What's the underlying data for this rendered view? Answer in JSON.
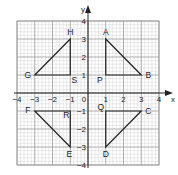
{
  "diagram": {
    "type": "coordinate-grid",
    "axes": {
      "x_label": "x",
      "y_label": "y",
      "x_range": [
        -4,
        4
      ],
      "y_range": [
        -4,
        4
      ],
      "x_ticks": [
        "-4",
        "-3",
        "-2",
        "-1",
        "0",
        "1",
        "2",
        "3",
        "4"
      ],
      "y_ticks": [
        "4",
        "3",
        "2",
        "1",
        "-1",
        "-2",
        "-3",
        "-4"
      ],
      "origin_label": "0"
    },
    "grid": {
      "major_step": 1,
      "minor_step": 0.2
    },
    "shapes": [
      {
        "name": "triangle-ABP",
        "vertices": [
          {
            "label": "A",
            "x": 1,
            "y": 3
          },
          {
            "label": "B",
            "x": 3,
            "y": 1
          },
          {
            "label": "P",
            "x": 1,
            "y": 1
          }
        ]
      },
      {
        "name": "triangle-HGS",
        "vertices": [
          {
            "label": "H",
            "x": -1,
            "y": 3
          },
          {
            "label": "G",
            "x": -3,
            "y": 1
          },
          {
            "label": "S",
            "x": -1,
            "y": 1
          }
        ]
      },
      {
        "name": "triangle-FER",
        "vertices": [
          {
            "label": "F",
            "x": -3,
            "y": -1
          },
          {
            "label": "E",
            "x": -1,
            "y": -3
          },
          {
            "label": "R",
            "x": -1,
            "y": -1
          }
        ]
      },
      {
        "name": "triangle-QCD",
        "vertices": [
          {
            "label": "Q",
            "x": 1,
            "y": -1
          },
          {
            "label": "C",
            "x": 3,
            "y": -1
          },
          {
            "label": "D",
            "x": 1,
            "y": -3
          }
        ]
      }
    ],
    "colors": {
      "grid_minor": "#d4d4d4",
      "grid_major": "#9a9a9a",
      "axis": "#222222",
      "shape": "#222222"
    }
  }
}
